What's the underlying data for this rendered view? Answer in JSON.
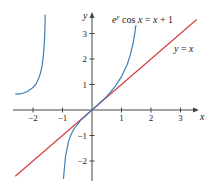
{
  "chart_data": {
    "type": "line",
    "title": "",
    "xlabel": "x",
    "ylabel": "y",
    "xlim": [
      -2.6,
      3.6
    ],
    "ylim": [
      -2.7,
      3.8
    ],
    "grid": false,
    "x_ticks": [
      -2,
      -1,
      1,
      2,
      3
    ],
    "y_ticks": [
      -2,
      -1,
      1,
      2,
      3
    ],
    "x_tick_labels": [
      "−2",
      "−1",
      "1",
      "2",
      "3"
    ],
    "y_tick_labels": [
      "−2",
      "−1",
      "1",
      "2",
      "3"
    ],
    "annotations": [
      {
        "text": "e^y cos x = x + 1",
        "x": 0.7,
        "y": 3.4
      },
      {
        "text": "y = x",
        "x": 2.75,
        "y": 2.3
      }
    ],
    "series": [
      {
        "name": "y = x",
        "color": "#d0413f",
        "x": [
          -2.6,
          3.55
        ],
        "y": [
          -2.6,
          3.55
        ]
      },
      {
        "name": "e^y cos x = x + 1 (left branch)",
        "color": "#3d7fb8",
        "x": [
          -2.6,
          -2.4,
          -2.2,
          -2.0,
          -1.9,
          -1.8,
          -1.75,
          -1.7,
          -1.65,
          -1.62,
          -1.6,
          -1.59,
          -1.585
        ],
        "y": [
          0.624,
          0.641,
          0.712,
          0.877,
          1.02,
          1.259,
          1.44,
          1.693,
          2.105,
          2.534,
          3.02,
          3.42,
          3.75
        ]
      },
      {
        "name": "e^y cos x = x + 1 (center branch)",
        "color": "#3d7fb8",
        "x": [
          -0.966,
          -0.95,
          -0.9,
          -0.8,
          -0.7,
          -0.6,
          -0.4,
          -0.2,
          0,
          0.2,
          0.4,
          0.6,
          0.8,
          1.0,
          1.2,
          1.3,
          1.4,
          1.45,
          1.47,
          1.49
        ],
        "y": [
          -2.7,
          -2.45,
          -1.83,
          -1.25,
          -0.94,
          -0.724,
          -0.429,
          -0.203,
          0,
          0.203,
          0.419,
          0.662,
          0.949,
          1.309,
          1.804,
          2.151,
          2.648,
          3.012,
          3.2,
          3.33
        ]
      }
    ]
  },
  "labels": {
    "equation_e": "e",
    "equation_sup": "y",
    "equation_rest_1": " cos ",
    "equation_x": "x",
    "equation_rest_2": " = ",
    "equation_x2": "x",
    "equation_rest_3": " + 1",
    "line_y": "y",
    "line_eq": " = ",
    "line_x": "x"
  }
}
